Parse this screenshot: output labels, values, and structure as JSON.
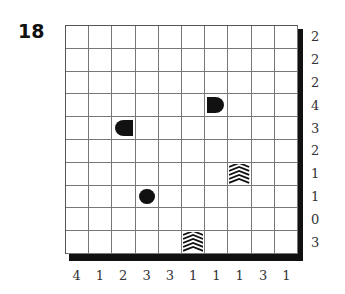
{
  "puzzle": {
    "number": "18",
    "type": "battleships",
    "size": 10,
    "row_clues": [
      "2",
      "2",
      "2",
      "4",
      "3",
      "2",
      "1",
      "1",
      "0",
      "3"
    ],
    "col_clues": [
      "4",
      "1",
      "2",
      "3",
      "3",
      "1",
      "1",
      "1",
      "3",
      "1"
    ],
    "given_pieces": [
      {
        "row": 3,
        "col": 6,
        "kind": "end-right",
        "name": "ship-end-right-icon"
      },
      {
        "row": 4,
        "col": 2,
        "kind": "end-left",
        "name": "ship-end-left-icon"
      },
      {
        "row": 6,
        "col": 7,
        "kind": "unknown",
        "name": "ship-segment-unknown-icon"
      },
      {
        "row": 7,
        "col": 3,
        "kind": "circle",
        "name": "submarine-icon"
      },
      {
        "row": 9,
        "col": 5,
        "kind": "unknown",
        "name": "ship-segment-unknown-icon"
      }
    ]
  },
  "colors": {
    "piece": "#111111",
    "grid_line": "#777777",
    "shadow": "#111111"
  }
}
